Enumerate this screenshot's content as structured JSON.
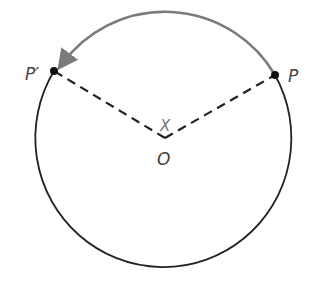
{
  "diagram": {
    "labels": {
      "point_p": "P",
      "point_p_prime": "P′",
      "center": "O",
      "angle": "X"
    },
    "colors": {
      "circle": "#222222",
      "rotation_arrow": "#7a7a7a",
      "radius_lines": "#222222",
      "points": "#111111"
    }
  }
}
